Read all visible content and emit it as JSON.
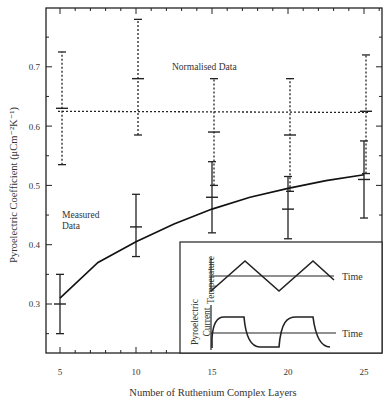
{
  "chart_data": {
    "type": "line",
    "title": "",
    "xlabel": "Number of Ruthenium Complex Layers",
    "ylabel": "Pyroelectric Coefficient  (μCm⁻²K⁻¹)",
    "xlim": [
      4,
      26
    ],
    "ylim": [
      0.2,
      0.79
    ],
    "x_ticks": [
      5,
      10,
      15,
      20,
      25
    ],
    "y_ticks": [
      0.3,
      0.4,
      0.5,
      0.6,
      0.7
    ],
    "grid": false,
    "series": [
      {
        "name": "Measured Data",
        "style": "solid",
        "x": [
          5,
          10,
          15,
          20,
          25
        ],
        "values": [
          0.3,
          0.43,
          0.48,
          0.46,
          0.51
        ],
        "error_low": [
          0.25,
          0.38,
          0.42,
          0.41,
          0.445
        ],
        "error_high": [
          0.35,
          0.485,
          0.54,
          0.515,
          0.575
        ]
      },
      {
        "name": "Normalised Data",
        "style": "dashed",
        "x": [
          5,
          10,
          15,
          20,
          25
        ],
        "values": [
          0.63,
          0.68,
          0.59,
          0.585,
          0.625
        ],
        "error_low": [
          0.535,
          0.585,
          0.5,
          0.49,
          0.52
        ],
        "error_high": [
          0.725,
          0.78,
          0.68,
          0.68,
          0.72
        ]
      },
      {
        "name": "Measured fit",
        "style": "solid-curve",
        "x": [
          5,
          7.5,
          10,
          12.5,
          15,
          17.5,
          20,
          22.5,
          25
        ],
        "values": [
          0.31,
          0.37,
          0.405,
          0.435,
          0.46,
          0.48,
          0.495,
          0.508,
          0.518
        ]
      },
      {
        "name": "Normalised mean",
        "style": "dashed-horizontal",
        "x": [
          5,
          25
        ],
        "values": [
          0.625,
          0.623
        ]
      }
    ],
    "annotations": [
      {
        "text": "Normalised Data",
        "x": 13,
        "y": 0.705
      },
      {
        "text": "Measured\nData",
        "x": 6,
        "y": 0.42
      }
    ],
    "inset": {
      "panels": [
        {
          "ylabel": "Temperature",
          "xlabel": "Time",
          "waveform": "triangle"
        },
        {
          "ylabel": "Pyroelectric Current",
          "xlabel": "Time",
          "waveform": "square-rc"
        }
      ]
    }
  },
  "labels": {
    "xlabel": "Number of Ruthenium Complex Layers",
    "ylabel": "Pyroelectric Coefficient  (μCm⁻²K⁻¹)",
    "x_ticks": [
      "5",
      "10",
      "15",
      "20",
      "25"
    ],
    "y_ticks": [
      "0.3",
      "0.4",
      "0.5",
      "0.6",
      "0.7"
    ],
    "normalised": "Normalised Data",
    "measured_line1": "Measured",
    "measured_line2": "Data",
    "inset_temp_label": "Temperature",
    "inset_current_label1": "Pyroelectric",
    "inset_current_label2": "Current",
    "inset_time1": "Time",
    "inset_time2": "Time"
  }
}
